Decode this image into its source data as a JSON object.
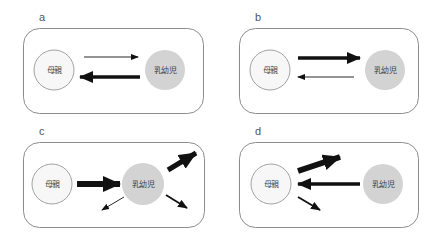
{
  "figure": {
    "panels": [
      {
        "label": "a",
        "mother": "母親",
        "infant": "乳幼児",
        "arrows": [
          {
            "from": "mother",
            "to": "infant",
            "weight": "thin"
          },
          {
            "from": "infant",
            "to": "mother",
            "weight": "thick"
          }
        ]
      },
      {
        "label": "b",
        "mother": "母親",
        "infant": "乳幼児",
        "arrows": [
          {
            "from": "mother",
            "to": "infant",
            "weight": "thick"
          },
          {
            "from": "infant",
            "to": "mother",
            "weight": "thin"
          }
        ]
      },
      {
        "label": "c",
        "mother": "母親",
        "infant": "乳幼児",
        "arrows": [
          {
            "from": "mother",
            "to": "infant",
            "weight": "thick"
          },
          {
            "from": "infant",
            "to": "outward-upper-right",
            "weight": "thick"
          },
          {
            "from": "infant",
            "to": "outward-lower-left",
            "weight": "thin"
          },
          {
            "from": "infant",
            "to": "outward-lower-right",
            "weight": "medium"
          }
        ]
      },
      {
        "label": "d",
        "mother": "母親",
        "infant": "乳幼児",
        "arrows": [
          {
            "from": "infant",
            "to": "mother",
            "weight": "thick"
          },
          {
            "from": "mother",
            "to": "outward-upper-right",
            "weight": "thick"
          },
          {
            "from": "mother",
            "to": "outward-lower-right",
            "weight": "medium"
          }
        ]
      }
    ],
    "colors": {
      "box_border": "#8c8c8c",
      "mother_fill": "#f7f7f7",
      "mother_border": "#8c8c8c",
      "infant_fill": "#d3d3d3",
      "arrow": "#111111",
      "text": "#444444"
    }
  }
}
